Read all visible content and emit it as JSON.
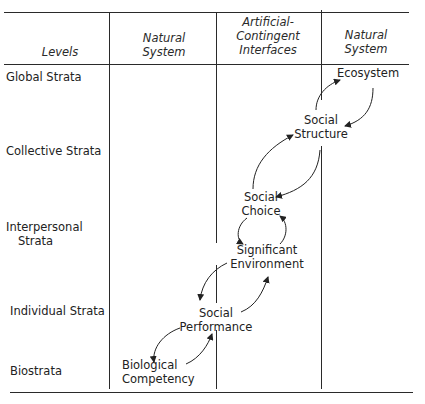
{
  "header": {
    "levels": "Levels",
    "col1": [
      "Natural",
      "System"
    ],
    "col2": [
      "Artificial-",
      "Contingent",
      "Interfaces"
    ],
    "col3": [
      "Natural",
      "System"
    ]
  },
  "levels": [
    {
      "label": "Global Strata"
    },
    {
      "label": "Collective Strata"
    },
    {
      "label_lines": [
        "Interpersonal",
        "Strata"
      ]
    },
    {
      "label": "Individual Strata"
    },
    {
      "label": "Biostrata"
    }
  ],
  "nodes": {
    "ecosystem": [
      "Ecosystem"
    ],
    "social_structure": [
      "Social",
      "Structure"
    ],
    "social_choice": [
      "Social",
      "Choice"
    ],
    "significant_environment": [
      "Significant",
      "Environment"
    ],
    "social_performance": [
      "Social",
      "Performance"
    ],
    "biological_competency": [
      "Biological",
      "Competency"
    ]
  },
  "colors": {
    "line": "#2a2a2a",
    "text": "#222222"
  }
}
